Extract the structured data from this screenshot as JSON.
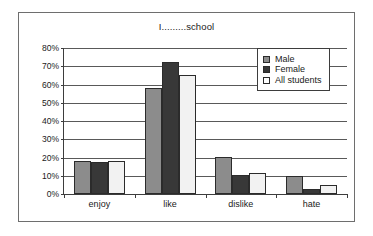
{
  "figure": {
    "title": "I.........school"
  },
  "legend": {
    "position": "top-right",
    "items": [
      {
        "label": "Male",
        "swatch": "legend-swatch-male",
        "color": "#8c8c8c"
      },
      {
        "label": "Female",
        "swatch": "legend-swatch-female",
        "color": "#383838"
      },
      {
        "label": "All students",
        "swatch": "legend-swatch-all-students",
        "color": "#ffffff"
      }
    ]
  },
  "axes": {
    "y_ticks": [
      "0%",
      "10%",
      "20%",
      "30%",
      "40%",
      "50%",
      "60%",
      "70%",
      "80%"
    ],
    "x_ticks": [
      "enjoy",
      "like",
      "dislike",
      "hate"
    ]
  },
  "chart_data": {
    "type": "bar",
    "title": "I.........school",
    "xlabel": "",
    "ylabel": "",
    "ylim": [
      0,
      80
    ],
    "ytick_step": 10,
    "ytick_suffix": "%",
    "grid": true,
    "legend_position": "top-right",
    "categories": [
      "enjoy",
      "like",
      "dislike",
      "hate"
    ],
    "series": [
      {
        "name": "Male",
        "color": "#8c8c8c",
        "values": [
          18,
          58,
          20.5,
          10
        ]
      },
      {
        "name": "Female",
        "color": "#383838",
        "values": [
          17.5,
          72.5,
          10.5,
          3
        ]
      },
      {
        "name": "All students",
        "color": "#f2f2f2",
        "values": [
          18,
          65,
          11.5,
          5
        ]
      }
    ]
  }
}
